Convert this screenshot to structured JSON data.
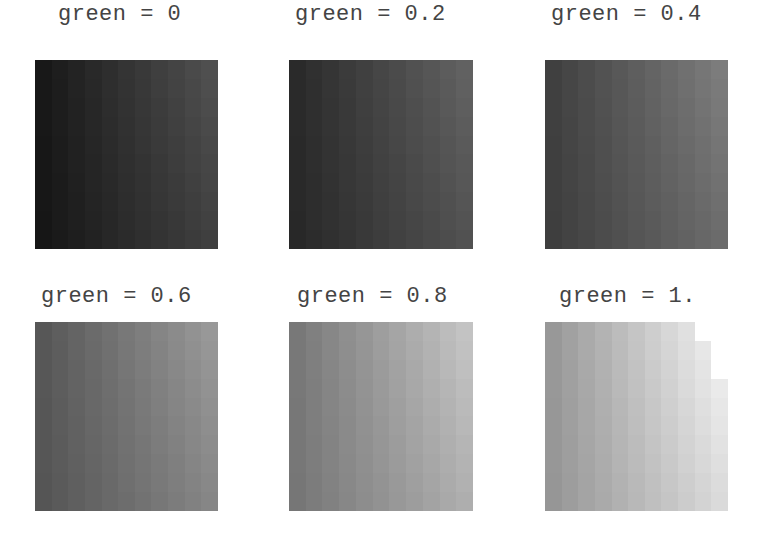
{
  "figure": {
    "background": "#ffffff",
    "label_color": "#444444",
    "panels": [
      {
        "label": "green = 0",
        "green": 0.0,
        "label_x": 58,
        "label_y": 2,
        "x": 35,
        "y": 60,
        "w": 183,
        "h": 189,
        "base": 22,
        "range": 55
      },
      {
        "label": "green = 0.2",
        "green": 0.2,
        "label_x": 295,
        "label_y": 2,
        "x": 289,
        "y": 60,
        "w": 184,
        "h": 189,
        "base": 40,
        "range": 55
      },
      {
        "label": "green = 0.4",
        "green": 0.4,
        "label_x": 551,
        "label_y": 2,
        "x": 545,
        "y": 60,
        "w": 183,
        "h": 189,
        "base": 62,
        "range": 60
      },
      {
        "label": "green = 0.6",
        "green": 0.6,
        "label_x": 41,
        "label_y": 284,
        "x": 35,
        "y": 322,
        "w": 183,
        "h": 189,
        "base": 85,
        "range": 65
      },
      {
        "label": "green = 0.8",
        "green": 0.8,
        "label_x": 297,
        "label_y": 284,
        "x": 289,
        "y": 322,
        "w": 184,
        "h": 189,
        "base": 118,
        "range": 75
      },
      {
        "label": "green = 1.",
        "green": 1.0,
        "label_x": 559,
        "label_y": 284,
        "x": 545,
        "y": 322,
        "w": 183,
        "h": 189,
        "base": 150,
        "range": 90,
        "notch": true
      }
    ],
    "grid": {
      "cols": 11,
      "rows": 10
    }
  }
}
